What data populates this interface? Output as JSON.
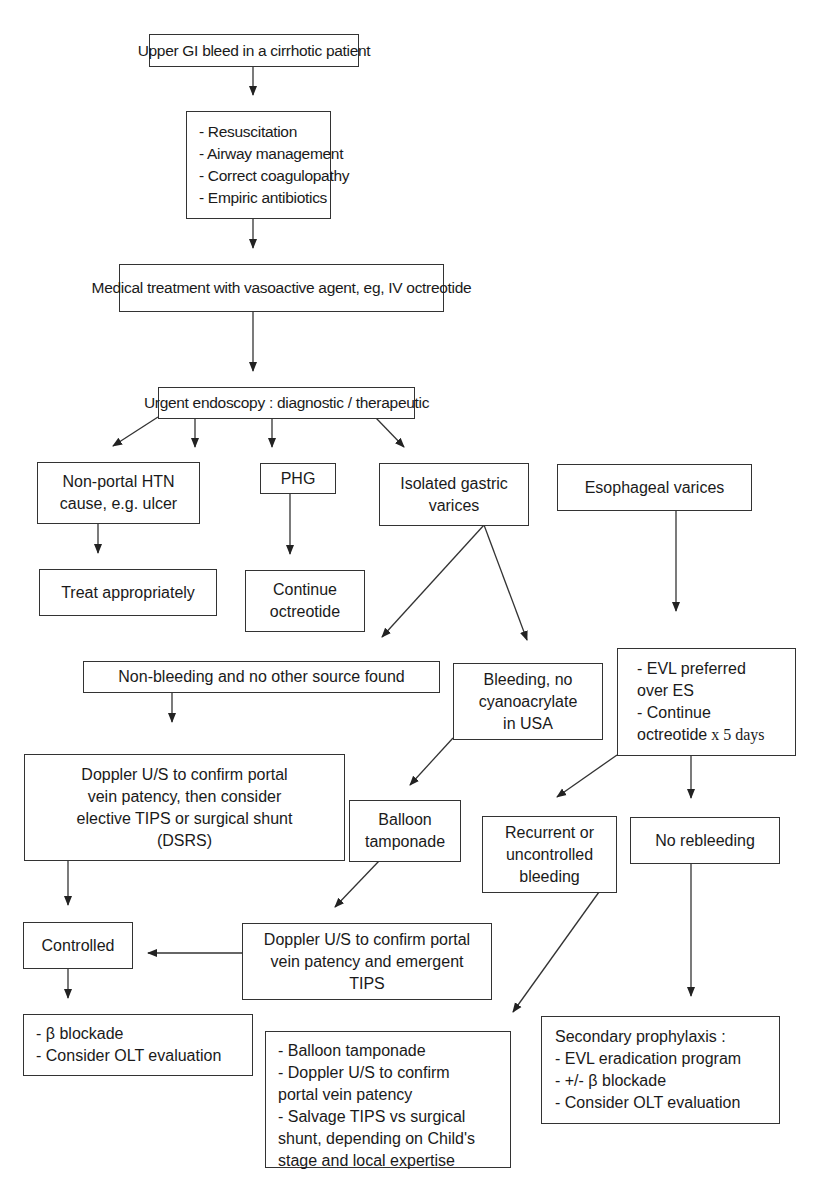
{
  "diagram": {
    "title": "Upper GI bleed in a cirrhotic patient",
    "nodes": {
      "start": {
        "lines": [
          "Upper GI bleed in a cirrhotic patient"
        ]
      },
      "initial_care": {
        "lines": [
          "- Resuscitation",
          "- Airway management",
          "- Correct coagulopathy",
          "- Empiric antibiotics"
        ]
      },
      "medical_treatment": {
        "lines": [
          "Medical treatment with vasoactive agent, eg, IV octreotide"
        ]
      },
      "endoscopy": {
        "lines": [
          "Urgent endoscopy : diagnostic / therapeutic"
        ]
      },
      "non_portal": {
        "lines": [
          "Non-portal HTN",
          "cause, e.g. ulcer"
        ]
      },
      "phg": {
        "lines": [
          "PHG"
        ]
      },
      "gastric_varices": {
        "lines": [
          "Isolated gastric",
          "varices"
        ]
      },
      "esophageal_varices": {
        "lines": [
          "Esophageal varices"
        ]
      },
      "treat_appropriately": {
        "lines": [
          "Treat appropriately"
        ]
      },
      "continue_octreotide": {
        "lines": [
          "Continue",
          "octreotide"
        ]
      },
      "non_bleeding": {
        "lines": [
          "Non-bleeding and no other source found"
        ]
      },
      "bleeding_no_cyano": {
        "lines": [
          "Bleeding, no",
          "cyanoacrylate",
          "in USA"
        ]
      },
      "evl": {
        "lines": [
          "- EVL preferred",
          "over ES",
          "- Continue",
          "octreotide"
        ],
        "suffix": " x 5 days"
      },
      "doppler_elective": {
        "lines": [
          "Doppler U/S to confirm portal",
          "vein patency, then consider",
          "elective TIPS or surgical shunt",
          "(DSRS)"
        ]
      },
      "balloon_tamponade": {
        "lines": [
          "Balloon",
          "tamponade"
        ]
      },
      "recurrent_bleeding": {
        "lines": [
          "Recurrent or",
          "uncontrolled",
          "bleeding"
        ]
      },
      "no_rebleeding": {
        "lines": [
          "No rebleeding"
        ]
      },
      "controlled": {
        "lines": [
          "Controlled"
        ]
      },
      "doppler_emergent": {
        "lines": [
          "Doppler U/S to confirm portal",
          "vein patency and emergent",
          "TIPS"
        ]
      },
      "beta_blockade": {
        "lines": [
          "- β blockade",
          "- Consider OLT evaluation"
        ]
      },
      "salvage": {
        "lines": [
          "- Balloon tamponade",
          "- Doppler U/S to confirm",
          "portal vein patency",
          "- Salvage TIPS vs surgical",
          "shunt, depending on Child's",
          "stage and local expertise"
        ]
      },
      "secondary_prophylaxis": {
        "lines": [
          "Secondary prophylaxis :",
          "- EVL eradication program",
          "- +/- β blockade",
          "- Consider OLT evaluation"
        ]
      }
    },
    "edges": [
      [
        "start",
        "initial_care"
      ],
      [
        "initial_care",
        "medical_treatment"
      ],
      [
        "medical_treatment",
        "endoscopy"
      ],
      [
        "endoscopy",
        "non_portal"
      ],
      [
        "endoscopy",
        "phg"
      ],
      [
        "endoscopy",
        "gastric_varices"
      ],
      [
        "endoscopy",
        "esophageal_varices"
      ],
      [
        "non_portal",
        "treat_appropriately"
      ],
      [
        "phg",
        "continue_octreotide"
      ],
      [
        "gastric_varices",
        "non_bleeding"
      ],
      [
        "gastric_varices",
        "bleeding_no_cyano"
      ],
      [
        "esophageal_varices",
        "evl"
      ],
      [
        "non_bleeding",
        "doppler_elective"
      ],
      [
        "bleeding_no_cyano",
        "balloon_tamponade"
      ],
      [
        "evl",
        "recurrent_bleeding"
      ],
      [
        "evl",
        "no_rebleeding"
      ],
      [
        "doppler_elective",
        "controlled"
      ],
      [
        "balloon_tamponade",
        "doppler_emergent"
      ],
      [
        "doppler_emergent",
        "controlled"
      ],
      [
        "recurrent_bleeding",
        "salvage"
      ],
      [
        "no_rebleeding",
        "secondary_prophylaxis"
      ],
      [
        "controlled",
        "beta_blockade"
      ]
    ],
    "colors": {
      "line": "#333333",
      "text": "#1a1a1a",
      "background": "#ffffff"
    }
  }
}
